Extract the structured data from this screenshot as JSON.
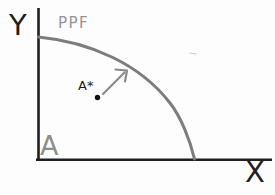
{
  "diagram": {
    "labels": {
      "y_axis": "Y",
      "x_axis": "X",
      "curve": "PPF",
      "point": "A*",
      "origin": "A"
    },
    "colors": {
      "axis": "#1f1f1f",
      "curve": "#7d7d7d",
      "arrow": "#8a8a8a",
      "point": "#111111",
      "gray_text": "#8e8e8e",
      "black_text": "#1f1f1f",
      "stray_mark": "#cccccc",
      "background": "#fdfdfd"
    }
  }
}
